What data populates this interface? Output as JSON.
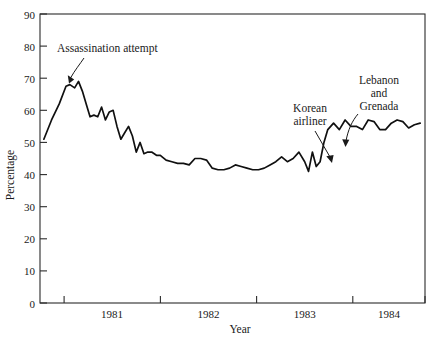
{
  "chart_data": {
    "type": "line",
    "title": "",
    "xlabel": "Year",
    "ylabel": "Percentage",
    "ylim": [
      0,
      90
    ],
    "ytick_labels": [
      "0",
      "10",
      "20",
      "30",
      "40",
      "50",
      "60",
      "70",
      "80",
      "90"
    ],
    "ytick_values": [
      0,
      10,
      20,
      30,
      40,
      50,
      60,
      70,
      80,
      90
    ],
    "xtick_labels": [
      "1981",
      "1982",
      "1983",
      "1984"
    ],
    "xlim": [
      1980.75,
      1984.75
    ],
    "xtick_values": [
      1981.25,
      1982.25,
      1983.25,
      1984.25
    ],
    "xtick_minor_values": [
      1981.0,
      1982.0,
      1983.0,
      1984.0,
      1984.75
    ],
    "grid": false,
    "legend": null,
    "series": [
      {
        "name": "Approval",
        "x": [
          1980.79,
          1980.87,
          1980.95,
          1981.02,
          1981.06,
          1981.11,
          1981.15,
          1981.19,
          1981.23,
          1981.27,
          1981.31,
          1981.35,
          1981.39,
          1981.43,
          1981.47,
          1981.51,
          1981.55,
          1981.59,
          1981.63,
          1981.67,
          1981.71,
          1981.75,
          1981.79,
          1981.83,
          1981.87,
          1981.91,
          1981.96,
          1982.0,
          1982.06,
          1982.12,
          1982.18,
          1982.24,
          1982.3,
          1982.36,
          1982.42,
          1982.48,
          1982.54,
          1982.6,
          1982.66,
          1982.72,
          1982.78,
          1982.84,
          1982.9,
          1982.96,
          1983.02,
          1983.08,
          1983.14,
          1983.2,
          1983.26,
          1983.32,
          1983.38,
          1983.44,
          1983.5,
          1983.54,
          1983.58,
          1983.62,
          1983.66,
          1983.7,
          1983.74,
          1983.8,
          1983.86,
          1983.92,
          1983.98,
          1984.04,
          1984.1,
          1984.16,
          1984.22,
          1984.28,
          1984.34,
          1984.4,
          1984.46,
          1984.52,
          1984.58,
          1984.64,
          1984.7
        ],
        "y": [
          51,
          57,
          62,
          67.5,
          68,
          67,
          69,
          66,
          62,
          58,
          58.5,
          58,
          61,
          57,
          59.5,
          60,
          55,
          51,
          53,
          55,
          52,
          47,
          50,
          46.5,
          47,
          47,
          46,
          46,
          44.5,
          44,
          43.5,
          43.5,
          43,
          45,
          45,
          44.5,
          42,
          41.5,
          41.5,
          42,
          43,
          42.5,
          42,
          41.5,
          41.5,
          42,
          43,
          44,
          45.5,
          44,
          45,
          47,
          44,
          41,
          47,
          42.5,
          44,
          50,
          54,
          56,
          54,
          57,
          55,
          55,
          54,
          57,
          56.5,
          54,
          54,
          56,
          57,
          56.5,
          54.5,
          55.5,
          56
        ]
      }
    ],
    "annotations": [
      {
        "id": "assassination",
        "lines": [
          "Assassination attempt"
        ],
        "text_x": 57,
        "text_y": 52,
        "anchor": "start"
      },
      {
        "id": "korean-airliner",
        "lines": [
          "Korean",
          "airliner"
        ],
        "text_x": 310,
        "text_y": 112,
        "anchor": "middle"
      },
      {
        "id": "lebanon-grenada",
        "lines": [
          "Lebanon",
          "and",
          "Grenada"
        ],
        "text_x": 379,
        "text_y": 84,
        "anchor": "middle"
      }
    ]
  }
}
